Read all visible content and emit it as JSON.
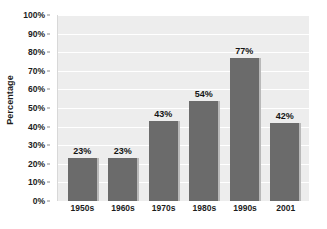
{
  "chart_data": {
    "type": "bar",
    "title": "",
    "subtitle": "",
    "xlabel": "",
    "ylabel": "Percentage",
    "categories": [
      "1950s",
      "1960s",
      "1970s",
      "1980s",
      "1990s",
      "2001"
    ],
    "values": [
      23,
      43,
      54,
      77,
      42,
      23
    ],
    "value_labels": [
      "23%",
      "23%",
      "43%",
      "54%",
      "77%",
      "42%"
    ],
    "series": [
      {
        "name": "Percentage",
        "values": [
          23,
          23,
          43,
          54,
          77,
          42
        ]
      }
    ],
    "ylim": [
      0,
      100
    ],
    "ytick_values": [
      0,
      10,
      20,
      30,
      40,
      50,
      60,
      70,
      80,
      90,
      100
    ],
    "ytick_labels": [
      "100%",
      "90%",
      "80%",
      "70%",
      "60%",
      "50%",
      "40%",
      "30%",
      "20%",
      "10%",
      "0%"
    ],
    "grid": "horizontal",
    "legend": "none",
    "annotations": []
  },
  "style": {
    "bar_color": "#6b6b6b",
    "bar_shadow_color": "#b9b9b9",
    "plot_background": "#ededed",
    "gridline_color": "#ffffff",
    "text_color": "#1c1c1c",
    "page_background": "#ffffff"
  }
}
